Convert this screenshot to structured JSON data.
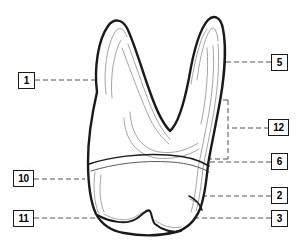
{
  "figure": {
    "background_color": "#ffffff",
    "outline_color": "#1a1a1a",
    "inner_line_color": "#7d7d7d",
    "leader_line_color": "#555555",
    "label_box_border_color": "#1a1a1a",
    "label_text_color": "#000000",
    "canvas": {
      "width": 298,
      "height": 249
    }
  },
  "labels": [
    {
      "id": "label-1",
      "text": "1",
      "side": "left",
      "box": {
        "x": 18,
        "y": 72,
        "w": 17,
        "h": 17
      },
      "leader": {
        "from_x": 35,
        "from_y": 80,
        "to_x": 125,
        "to_y": 80
      }
    },
    {
      "id": "label-5",
      "text": "5",
      "side": "right",
      "box": {
        "x": 271,
        "y": 54,
        "w": 17,
        "h": 17
      },
      "leader": {
        "from_x": 271,
        "from_y": 62,
        "to_x": 196,
        "to_y": 62
      }
    },
    {
      "id": "label-12",
      "text": "12",
      "side": "right",
      "box": {
        "x": 269,
        "y": 119,
        "w": 21,
        "h": 17
      },
      "leader": {
        "from_x": 269,
        "from_y": 128,
        "to_x": 228,
        "to_y": 128
      },
      "bracket": {
        "x": 228,
        "top_y": 100,
        "bottom_y": 158,
        "tip_len": 12
      }
    },
    {
      "id": "label-6",
      "text": "6",
      "side": "right",
      "box": {
        "x": 271,
        "y": 153,
        "w": 17,
        "h": 17
      },
      "leader": {
        "from_x": 271,
        "from_y": 162,
        "to_x": 150,
        "to_y": 162
      }
    },
    {
      "id": "label-10",
      "text": "10",
      "side": "left",
      "box": {
        "x": 13,
        "y": 170,
        "w": 21,
        "h": 17
      },
      "leader": {
        "from_x": 34,
        "from_y": 179,
        "to_x": 83,
        "to_y": 179
      }
    },
    {
      "id": "label-2",
      "text": "2",
      "side": "right",
      "box": {
        "x": 271,
        "y": 187,
        "w": 17,
        "h": 17
      },
      "leader": {
        "from_x": 271,
        "from_y": 196,
        "to_x": 188,
        "to_y": 196
      }
    },
    {
      "id": "label-11",
      "text": "11",
      "side": "left",
      "box": {
        "x": 13,
        "y": 210,
        "w": 21,
        "h": 17
      },
      "leader": {
        "from_x": 34,
        "from_y": 218,
        "to_x": 140,
        "to_y": 218
      }
    },
    {
      "id": "label-3",
      "text": "3",
      "side": "right",
      "box": {
        "x": 271,
        "y": 210,
        "w": 17,
        "h": 17
      },
      "leader": {
        "from_x": 271,
        "from_y": 218,
        "to_x": 192,
        "to_y": 218
      }
    }
  ],
  "diagram_paths": {
    "outer_outline": "M 97 92 C 94 68 98 40 108 26 C 114 18 122 19 127 28 C 134 42 142 70 150 92 C 157 112 163 124 170 130 C 178 124 184 104 189 78 C 193 54 199 30 208 20 C 214 14 220 17 222 28 C 226 48 224 80 218 110 C 213 137 210 152 208 164 C 206 184 204 198 200 208 C 195 220 186 228 176 231 C 160 235 140 235 124 232 C 112 230 102 224 96 213 C 90 200 88 180 88 160 C 88 138 92 114 97 92 Z",
    "cervical_line": "M 89 161 C 110 156 140 153 168 155 C 186 156 200 160 208 164",
    "cervical_line_lower": "M 90 168 C 112 162 142 159 170 161 C 188 162 202 166 209 170",
    "crown_bottom": "M 96 213 C 108 218 122 221 132 216 C 140 212 145 207 149 211 C 152 214 153 220 156 223 C 162 228 172 231 180 229",
    "inner_pulp": "M 113 100 C 112 76 116 50 124 38 C 128 32 133 35 136 45 C 142 66 150 92 158 110 C 163 122 167 130 170 134",
    "inner_root_right": "M 198 74 C 201 52 206 34 212 28 C 215 25 218 29 219 40 C 221 62 218 94 213 118",
    "pulp_chamber": "M 123 120 C 127 142 140 156 158 158 C 172 159 185 156 196 150"
  }
}
